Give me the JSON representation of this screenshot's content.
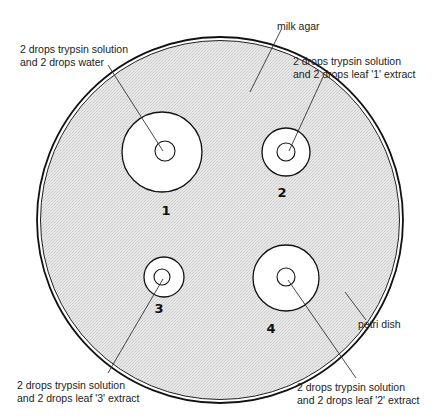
{
  "diagram": {
    "labels": {
      "milk_agar": "milk agar",
      "petri_dish": "petri dish",
      "zone1_line1": "2 drops trypsin solution",
      "zone1_line2": "and 2 drops water",
      "zone2_line1": "2 drops trypsin solution",
      "zone2_line2": "and 2 drops leaf '1' extract",
      "zone3_line1": "2 drops trypsin solution",
      "zone3_line2": "and 2 drops leaf '3' extract",
      "zone4_line1": "2 drops trypsin solution",
      "zone4_line2": "and 2 drops leaf '2' extract"
    },
    "wells": [
      {
        "number": "1",
        "treatment": "2 drops trypsin solution and 2 drops water"
      },
      {
        "number": "2",
        "treatment": "2 drops trypsin solution and 2 drops leaf '1' extract"
      },
      {
        "number": "3",
        "treatment": "2 drops trypsin solution and 2 drops leaf '3' extract"
      },
      {
        "number": "4",
        "treatment": "2 drops trypsin solution and 2 drops leaf '2' extract"
      }
    ],
    "colors": {
      "agar_fill": "#e4e4e4",
      "outline": "#111111",
      "clear_zone": "#ffffff"
    }
  }
}
